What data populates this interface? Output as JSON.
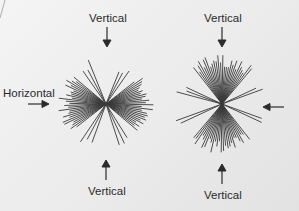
{
  "diagram": {
    "left_panel": {
      "top_label": "Vertical",
      "left_label": "Horizontal",
      "bottom_label": "Vertical",
      "description": "radial lines concentrated near horizontal (bow-tie)"
    },
    "right_panel": {
      "top_label": "Vertical",
      "bottom_label": "Vertical",
      "right_arrow": "arrow pointing left",
      "description": "radial lines concentrated near vertical (hourglass)"
    },
    "colors": {
      "background": "#ececec",
      "lines": "#3a3a3a",
      "text": "#2a2a2a"
    }
  }
}
